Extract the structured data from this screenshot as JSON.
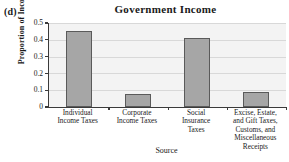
{
  "panel": {
    "label": "(d)"
  },
  "chart_data": {
    "type": "bar",
    "title": "Government Income",
    "xlabel": "Source",
    "ylabel": "Proportion of Income",
    "ylim": [
      0,
      0.5
    ],
    "yticks": [
      "0",
      "0.1",
      "0.2",
      "0.3",
      "0.4",
      "0.5"
    ],
    "ytick_values": [
      0,
      0.1,
      0.2,
      0.3,
      0.4,
      0.5
    ],
    "grid": true,
    "legend": false,
    "categories": [
      "Individual Income Taxes",
      "Corporate Income Taxes",
      "Social Insurance Taxes",
      "Excise, Estate, and Gift Taxes, Customs, and Miscellaneous Receipts"
    ],
    "category_lines": [
      [
        "Individual",
        "Income Taxes"
      ],
      [
        "Corporate",
        "Income Taxes"
      ],
      [
        "Social",
        "Insurance",
        "Taxes"
      ],
      [
        "Excise, Estate,",
        "and Gift Taxes,",
        "Customs, and",
        "Miscellaneous",
        "Receipts"
      ]
    ],
    "values": [
      0.45,
      0.08,
      0.41,
      0.09
    ],
    "bar_color": "#a6a6a6",
    "bar_edge_color": "#5a5a5a",
    "plot_background": "#f3f3f3",
    "axis_color": "#3a3a3a",
    "gridline_color": "#d8d8d8"
  }
}
